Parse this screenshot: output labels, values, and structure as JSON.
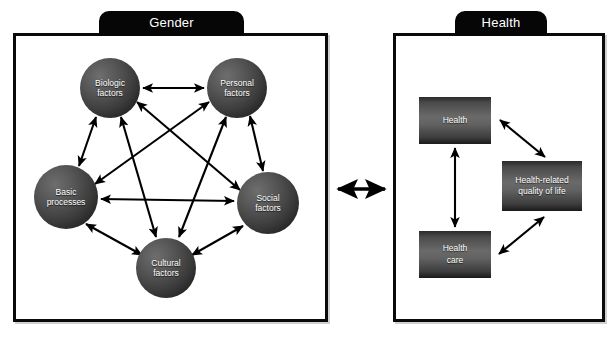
{
  "diagram": {
    "title_hidden": "Gender and Health conceptual model",
    "panels": [
      {
        "id": "gender",
        "tab_label": "Gender",
        "nodes": [
          {
            "id": "biologic",
            "label_line1": "Biologic",
            "label_line2": "factors"
          },
          {
            "id": "personal",
            "label_line1": "Personal",
            "label_line2": "factors"
          },
          {
            "id": "basic",
            "label_line1": "Basic",
            "label_line2": "processes"
          },
          {
            "id": "social",
            "label_line1": "Social",
            "label_line2": "factors"
          },
          {
            "id": "cultural",
            "label_line1": "Cultural",
            "label_line2": "factors"
          }
        ],
        "edges": [
          {
            "from": "biologic",
            "to": "personal",
            "kind": "bidirectional"
          },
          {
            "from": "biologic",
            "to": "basic",
            "kind": "bidirectional"
          },
          {
            "from": "biologic",
            "to": "social",
            "kind": "bidirectional"
          },
          {
            "from": "biologic",
            "to": "cultural",
            "kind": "bidirectional"
          },
          {
            "from": "personal",
            "to": "basic",
            "kind": "bidirectional"
          },
          {
            "from": "personal",
            "to": "social",
            "kind": "bidirectional"
          },
          {
            "from": "personal",
            "to": "cultural",
            "kind": "bidirectional"
          },
          {
            "from": "basic",
            "to": "social",
            "kind": "bidirectional"
          },
          {
            "from": "basic",
            "to": "cultural",
            "kind": "bidirectional"
          },
          {
            "from": "social",
            "to": "cultural",
            "kind": "bidirectional"
          }
        ]
      },
      {
        "id": "health",
        "tab_label": "Health",
        "nodes": [
          {
            "id": "health",
            "label_line1": "Health",
            "label_line2": ""
          },
          {
            "id": "hrqol",
            "label_line1": "Health-related",
            "label_line2": "quality of life"
          },
          {
            "id": "health-care",
            "label_line1": "Health",
            "label_line2": "care"
          }
        ],
        "edges": [
          {
            "from": "health",
            "to": "health-care",
            "kind": "bidirectional"
          },
          {
            "from": "health",
            "to": "hrqol",
            "kind": "bidirectional"
          },
          {
            "from": "health-care",
            "to": "hrqol",
            "kind": "bidirectional"
          }
        ]
      }
    ],
    "cross_link": {
      "from": "gender",
      "to": "health",
      "kind": "bidirectional"
    },
    "colors": {
      "frame": "#0a0a0a",
      "tab_background": "#060606",
      "tab_text": "#ffffff",
      "node_text": "#ffffff",
      "arrow": "#000000",
      "background": "#ffffff"
    }
  }
}
